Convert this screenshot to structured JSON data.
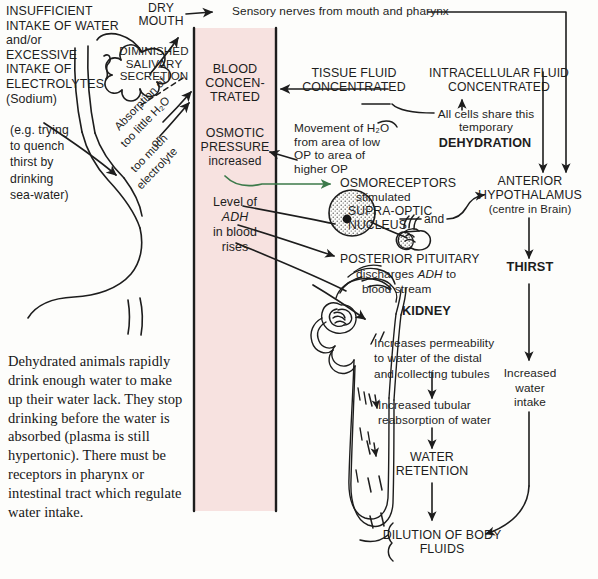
{
  "diagram": {
    "colors": {
      "band_fill": "#f7e2e0",
      "ink": "#1d1d1d",
      "green_arrow": "#3c7a4a",
      "paper": "#fdfdfb"
    }
  },
  "band": {
    "name": "blood-compartment-band",
    "labels": {
      "blood_concentrated": "BLOOD\nCONCEN-\nTRATED",
      "osmotic_pressure": "OSMOTIC\nPRESSURE",
      "osmotic_pressure_sub": "increased",
      "adh_level_line1": "Level of",
      "adh_level_line2": "ADH",
      "adh_level_line3": "in blood",
      "adh_level_line4": "rises"
    }
  },
  "left_column": {
    "cause_block": "INSUFFICIENT\nINTAKE OF WATER\nand/or\nEXCESSIVE\nINTAKE OF\nELECTROLYTES\n(Sodium)",
    "cause_note": "(e.g. trying\nto quench\nthirst by\ndrinking\nsea-water)",
    "salivary": "DIMINISHED\nSALIVARY\nSECRETION",
    "absorption_line1": "Absorption of",
    "absorption_line2": "too little H₂O",
    "absorption_line3": "or",
    "absorption_line4": "too much",
    "absorption_line5": "electrolyte",
    "paragraph": "    Dehydrated animals rapidly drink enough water to make up their water lack. They stop drinking before the water is absorbed (plasma is still hypertonic). There must be receptors in pharynx or intestinal tract which regulate water intake."
  },
  "top": {
    "dry_mouth": "DRY\nMOUTH",
    "sensory_nerves": "Sensory nerves from mouth and pharynx"
  },
  "middle_column": {
    "tissue_fluid": "TISSUE FLUID\nCONCENTRATED",
    "movement_note": "Movement of H₂O\nfrom area of low\nOP to area of\nhigher OP",
    "osmoreceptors": "OSMORECEPTORS",
    "osmoreceptors_sub": "stimulated",
    "supra_optic": "SUPRA-OPTIC",
    "nucleus": "NUCLEUS",
    "and_connector": "and",
    "posterior_pituitary": "POSTERIOR PITUITARY",
    "posterior_pituitary_sub1": "discharges ",
    "posterior_pituitary_adh": "ADH",
    "posterior_pituitary_sub2": " to",
    "posterior_pituitary_sub3": "blood stream",
    "kidney": "KIDNEY",
    "kidney_effect": "Increases permeability\nto water of the distal\nand collecting tubules",
    "tubular_reabsorption": "Increased tubular\nreabsorption of water",
    "water_retention": "WATER\nRETENTION",
    "dilution": "DILUTION OF BODY\nFLUIDS"
  },
  "right_column": {
    "intracellular": "INTRACELLULAR FLUID\nCONCENTRATED",
    "all_cells_line1": "All cells share this",
    "all_cells_line2": "temporary",
    "dehydration": "DEHYDRATION",
    "anterior_hypothalamus": "ANTERIOR\nHYPOTHALAMUS",
    "centre_in_brain": "(centre in Brain)",
    "thirst": "THIRST",
    "increased_intake": "Increased\nwater\nintake"
  }
}
